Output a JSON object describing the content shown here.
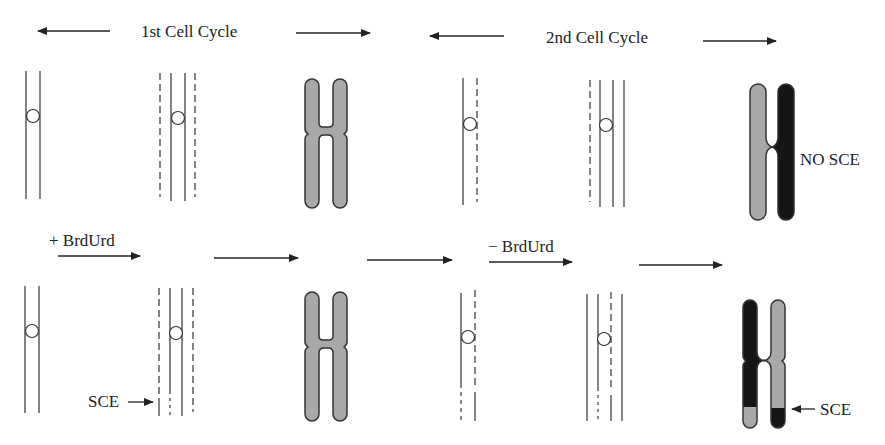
{
  "labels": {
    "cycle1": "1st Cell Cycle",
    "cycle2": "2nd Cell Cycle",
    "plus_brdurd": "+ BrdUrd",
    "minus_brdurd": "− BrdUrd",
    "no_sce": "NO SCE",
    "sce_left": "SCE",
    "sce_right": "SCE"
  },
  "colors": {
    "line": "#333333",
    "chromatid_light": "#a8a8a8",
    "chromatid_dark": "#151515",
    "outline": "#333333"
  },
  "rows": [
    {
      "name": "top-row",
      "outcome": "NO SCE"
    },
    {
      "name": "bottom-row",
      "outcome": "SCE"
    }
  ]
}
